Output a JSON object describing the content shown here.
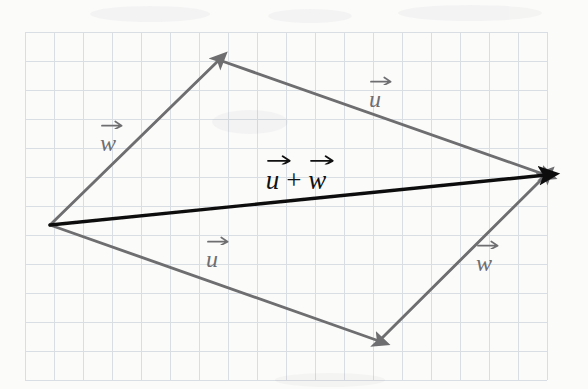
{
  "figure": {
    "background_color": "#fbfbfa",
    "width": 588,
    "height": 389
  },
  "grid": {
    "name": "graph-paper-grid",
    "line_color": "#d9dee4",
    "line_width": 1,
    "cell_size": 29,
    "origin_x": 25,
    "origin_y": 32,
    "cols": 18,
    "rows": 12,
    "right_edge": 547,
    "bottom_edge": 380
  },
  "colors": {
    "vector_gray": "#6e6e70",
    "vector_black": "#111111",
    "grid": "#d9dee4",
    "paper": "#fbfbfa"
  },
  "chart_data": {
    "type": "diagram",
    "xlabel": "",
    "ylabel": "",
    "grid": true,
    "points": {
      "origin": [
        50,
        225
      ],
      "top_vertex": [
        219,
        60
      ],
      "right_vertex": [
        546,
        175
      ],
      "bottom_vertex": [
        379,
        341
      ]
    },
    "vectors": [
      {
        "id": "w-upper-left",
        "label": "w",
        "accent": "arrow",
        "color": "#6e6e70",
        "from": [
          50,
          225
        ],
        "to": [
          219,
          60
        ],
        "arrowhead": "end",
        "label_pos": [
          108,
          143
        ]
      },
      {
        "id": "u-upper-right",
        "label": "u",
        "accent": "arrow",
        "color": "#6e6e70",
        "from": [
          219,
          60
        ],
        "to": [
          546,
          175
        ],
        "arrowhead": "end",
        "label_pos": [
          375,
          99
        ]
      },
      {
        "id": "u-lower-left",
        "label": "u",
        "accent": "arrow",
        "color": "#6e6e70",
        "from": [
          50,
          225
        ],
        "to": [
          379,
          341
        ],
        "arrowhead": "end",
        "label_pos": [
          212,
          259
        ]
      },
      {
        "id": "w-lower-right",
        "label": "w",
        "accent": "arrow",
        "color": "#6e6e70",
        "from": [
          379,
          341
        ],
        "to": [
          546,
          175
        ],
        "arrowhead": "end",
        "label_pos": [
          484,
          263
        ]
      },
      {
        "id": "u-plus-w-resultant",
        "label": "u + w",
        "accent": "arrow",
        "color": "#111111",
        "from": [
          50,
          225
        ],
        "to": [
          546,
          175
        ],
        "arrowhead": "end",
        "label_pos": [
          296,
          180
        ]
      }
    ]
  },
  "labels": {
    "w_upper_left": "w",
    "u_upper_right": "u",
    "u_lower_left": "u",
    "w_lower_right": "w",
    "resultant_u": "u",
    "resultant_plus": "+",
    "resultant_w": "w"
  }
}
